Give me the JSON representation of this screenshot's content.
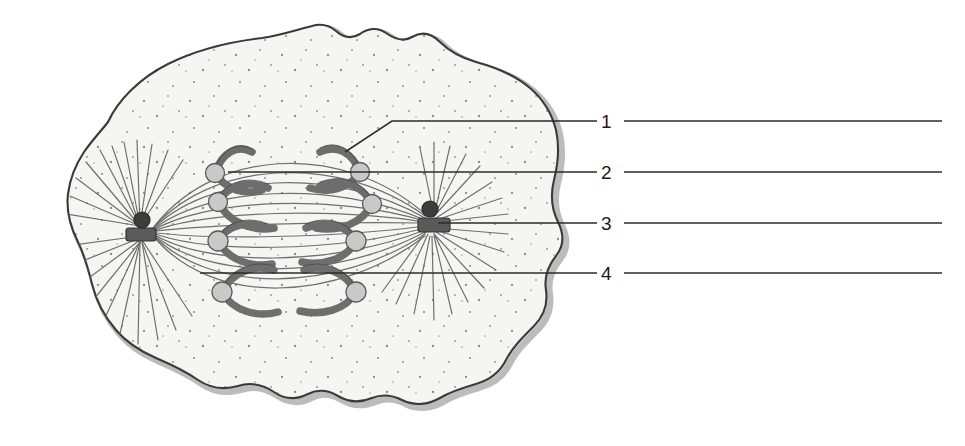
{
  "figure": {
    "caption": "",
    "background_color": "#ffffff"
  },
  "diagram": {
    "type": "biological-cell-diagram",
    "cell": {
      "name": "cell",
      "membrane_color": "#3a3a3a",
      "membrane_shadow_color": "#b4b4b4",
      "cytoplasm_color": "#f4f4f2",
      "stipple_color": "#8d8d8d",
      "shape": "irregular wavy rounded blob"
    },
    "structures": [
      {
        "name": "plasma-membrane",
        "count": 1
      },
      {
        "name": "cytoplasm",
        "count": 1
      },
      {
        "name": "centrosome-left",
        "count": 1
      },
      {
        "name": "centrosome-right",
        "count": 1
      },
      {
        "name": "aster-fibers",
        "count": 2
      },
      {
        "name": "spindle-fibers",
        "count": 1
      },
      {
        "name": "chromosome",
        "count": 6
      },
      {
        "name": "centromere",
        "count": 8
      }
    ],
    "chromosome_color": "#6e6e6e",
    "chromosome_outline_color": "#4a4a4a",
    "centromere_fill": "#c9c9c9",
    "centromere_outline": "#5a5a5a",
    "centriole_color": "#4c4c4c",
    "fiber_color": "#6b6b6b"
  },
  "labels": {
    "leader_line_color": "#2b2b2b",
    "items": [
      {
        "id": "label-1",
        "number": "1",
        "target": "chromosome-arm",
        "line_y": 121,
        "has_elbow": true,
        "elbow_x": 392,
        "target_x": 345,
        "target_y": 152
      },
      {
        "id": "label-2",
        "number": "2",
        "target": "centromere",
        "line_y": 172,
        "has_elbow": false,
        "target_x": 228,
        "target_y": 172
      },
      {
        "id": "label-3",
        "number": "3",
        "target": "centriole-pair",
        "line_y": 223,
        "has_elbow": false,
        "target_x": 438,
        "target_y": 223
      },
      {
        "id": "label-4",
        "number": "4",
        "target": "spindle-fiber",
        "line_y": 273,
        "has_elbow": false,
        "target_x": 392,
        "target_y": 273
      }
    ],
    "number_x": 602,
    "line_start_x": 624,
    "line_end_x": 942
  }
}
